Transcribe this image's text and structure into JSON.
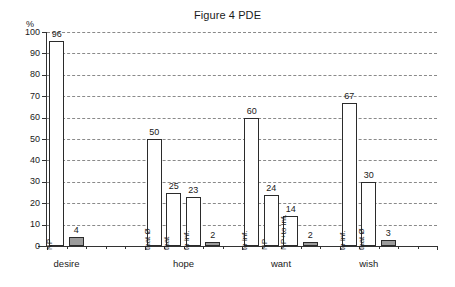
{
  "chart_data": {
    "type": "bar",
    "title": "Figure 4 PDE",
    "xlabel": "",
    "ylabel": "%",
    "ylim": [
      0,
      100
    ],
    "ytick_step": 10,
    "ytick_labels": [
      "100",
      "90",
      "80",
      "70",
      "60",
      "50",
      "40",
      "30",
      "20",
      "10",
      "0"
    ],
    "grid": true,
    "legend": "none",
    "categories": [
      "desire",
      "hope",
      "want",
      "wish"
    ],
    "groups": [
      {
        "category": "desire",
        "bars": [
          {
            "label": "NP",
            "value": 96,
            "value_text": "96",
            "style": "white"
          },
          {
            "label": "",
            "value": 4,
            "value_text": "4",
            "style": "gray"
          }
        ]
      },
      {
        "category": "hope",
        "bars": [
          {
            "label": "that Ø",
            "value": 50,
            "value_text": "50",
            "style": "white"
          },
          {
            "label": "that",
            "value": 25,
            "value_text": "25",
            "style": "white"
          },
          {
            "label": "to inf.",
            "value": 23,
            "value_text": "23",
            "style": "white"
          },
          {
            "label": "",
            "value": 2,
            "value_text": "2",
            "style": "gray"
          }
        ]
      },
      {
        "category": "want",
        "bars": [
          {
            "label": "to inf.",
            "value": 60,
            "value_text": "60",
            "style": "white"
          },
          {
            "label": "NP",
            "value": 24,
            "value_text": "24",
            "style": "white"
          },
          {
            "label": "NP+to inf.",
            "value": 14,
            "value_text": "14",
            "style": "white"
          },
          {
            "label": "",
            "value": 2,
            "value_text": "2",
            "style": "gray"
          }
        ]
      },
      {
        "category": "wish",
        "bars": [
          {
            "label": "to inf.",
            "value": 67,
            "value_text": "67",
            "style": "white"
          },
          {
            "label": "that Ø",
            "value": 30,
            "value_text": "30",
            "style": "white"
          },
          {
            "label": "",
            "value": 3,
            "value_text": "3",
            "style": "gray"
          }
        ]
      }
    ],
    "colors": {
      "white_bar_fill": "#ffffff",
      "gray_bar_fill": "#9c9c9c",
      "bar_border": "#2b2b2b",
      "gridline": "#8a8a8a",
      "axis": "#333333",
      "text": "#1a1a1a"
    }
  }
}
